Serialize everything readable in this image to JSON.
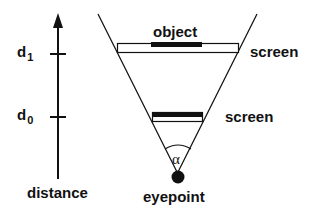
{
  "diagram": {
    "axis": {
      "label": "distance",
      "ticks": [
        {
          "symbol": "d",
          "subscript": "1"
        },
        {
          "symbol": "d",
          "subscript": "0"
        }
      ]
    },
    "labels": {
      "object": "object",
      "screen_far": "screen",
      "screen_near": "screen",
      "eyepoint": "eyepoint",
      "angle": "α"
    },
    "colors": {
      "stroke": "#111111",
      "fill": "#111111",
      "background": "#ffffff"
    }
  }
}
